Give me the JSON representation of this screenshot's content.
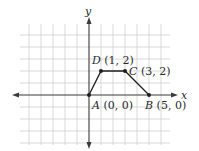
{
  "diagram": {
    "type": "coordinate-plane",
    "axes": {
      "x_label": "x",
      "y_label": "y",
      "origin_px": [
        89,
        95
      ],
      "unit_px": 12,
      "x_range": [
        -5,
        6
      ],
      "y_range": [
        -4,
        5
      ]
    },
    "colors": {
      "grid": "#cfcfcf",
      "axis": "#3a3a3a",
      "shape": "#1e1e1e",
      "text": "#2a2a2a"
    },
    "points": [
      {
        "name": "A",
        "coords": "(0, 0)",
        "x": 0,
        "y": 0
      },
      {
        "name": "B",
        "coords": "(5, 0)",
        "x": 5,
        "y": 0
      },
      {
        "name": "C",
        "coords": "(3, 2)",
        "x": 3,
        "y": 2
      },
      {
        "name": "D",
        "coords": "(1, 2)",
        "x": 1,
        "y": 2
      }
    ],
    "polygon_order": [
      "A",
      "D",
      "C",
      "B"
    ]
  }
}
